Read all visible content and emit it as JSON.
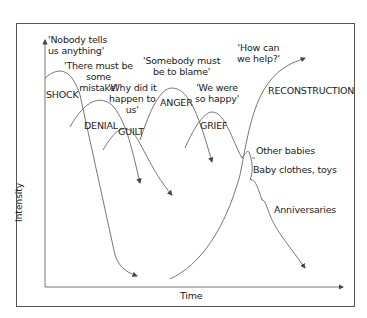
{
  "axes": {
    "y_label": "Intensity",
    "x_label": "Time"
  },
  "stages": [
    {
      "name": "SHOCK",
      "quote": "'Nobody tells us anything'"
    },
    {
      "name": "DENIAL",
      "quote": "'There must be some mistake'"
    },
    {
      "name": "GUILT",
      "quote": "'Why did it happen to us'"
    },
    {
      "name": "ANGER",
      "quote": "'Somebody must be to blame'"
    },
    {
      "name": "GRIEF",
      "quote": "'We were so happy'"
    },
    {
      "name": "RECONSTRUCTION",
      "quote": "'How can we help?'"
    }
  ],
  "quotes": {
    "shock_1": "'Nobody tells",
    "shock_2": "us anything'",
    "denial_1": "'There must be",
    "denial_2": "some",
    "denial_3": "mistake'",
    "guilt_1": "'Why did it",
    "guilt_2": "happen to",
    "guilt_3": "us'",
    "anger_1": "'Somebody must",
    "anger_2": "be to blame'",
    "grief_1": "'We were",
    "grief_2": "so happy'",
    "recon_1": "'How can",
    "recon_2": "we help?'"
  },
  "triggers": [
    "Other babies",
    "Baby clothes, toys",
    "Anniversaries"
  ],
  "colors": {
    "line": "#555555",
    "text": "#222222"
  }
}
